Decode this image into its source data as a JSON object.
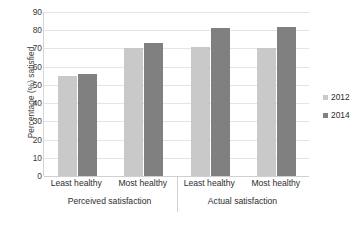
{
  "chart_data": {
    "type": "bar",
    "title": "",
    "xlabel": "",
    "ylabel": "Percentage (%) satisfied",
    "ylim": [
      0,
      90
    ],
    "ytick_step": 10,
    "yticks": [
      0,
      10,
      20,
      30,
      40,
      50,
      60,
      70,
      80,
      90
    ],
    "grid": true,
    "legend_position": "right",
    "categories": [
      "Least healthy",
      "Most healthy",
      "Least healthy",
      "Most healthy"
    ],
    "group_labels": [
      "Perceived satisfaction",
      "Actual satisfaction"
    ],
    "series": [
      {
        "name": "2012",
        "color": "#c9c9c9",
        "values": [
          55,
          70,
          71,
          70
        ]
      },
      {
        "name": "2014",
        "color": "#808080",
        "values": [
          56,
          73,
          81,
          82
        ]
      }
    ]
  },
  "legend": {
    "items": [
      {
        "label": "2012",
        "color": "#c9c9c9"
      },
      {
        "label": "2014",
        "color": "#808080"
      }
    ]
  },
  "axes": {
    "y_title": "Percentage (%) satisfied"
  }
}
